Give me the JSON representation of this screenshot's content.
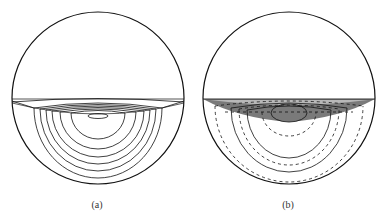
{
  "panels": [
    {
      "id": "a",
      "caption": "(a)",
      "center": [
        98,
        98
      ],
      "radius": 86,
      "chord_y": 99,
      "arcs_style": "solid",
      "shading": false
    },
    {
      "id": "b",
      "caption": "(b)",
      "center": [
        289,
        98
      ],
      "radius": 86,
      "chord_y": 99,
      "arcs_style": "mixed solid/dashed",
      "shading": true,
      "shade_dark": "#7a7a7a",
      "shade_light": "#b8b8b8"
    }
  ],
  "colors": {
    "stroke": "#111111",
    "background": "#ffffff"
  }
}
